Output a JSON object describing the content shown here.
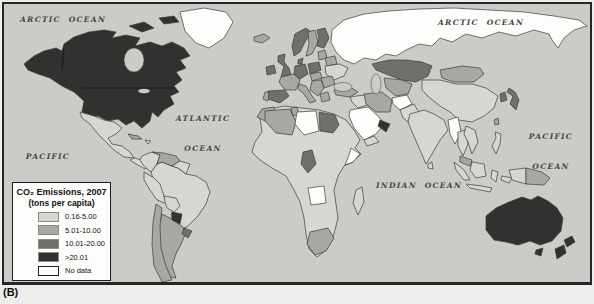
{
  "figure": {
    "caption": "(B)"
  },
  "legend": {
    "title": "CO₂ Emissions, 2007",
    "subtitle": "(tons per capita)",
    "classes": [
      {
        "label": "0.16-5.00",
        "color": "#d6d7d1"
      },
      {
        "label": "5.01-10.00",
        "color": "#a6a8a2"
      },
      {
        "label": "10.01-20.00",
        "color": "#6d706b"
      },
      {
        "label": ">20.01",
        "color": "#313230"
      },
      {
        "label": "No data",
        "color": "#fdfdfb"
      }
    ]
  },
  "map": {
    "ocean_color": "#cbccc7",
    "outline_color": "#3c3c3a",
    "labels": {
      "arctic_left": "ARCTIC  OCEAN",
      "arctic_right": "ARCTIC  OCEAN",
      "atlantic_line1": "ATLANTIC",
      "atlantic_line2": "OCEAN",
      "pacific_left_line1": "PACIFIC",
      "pacific_left_line2": "OCEAN",
      "pacific_right_line1": "PACIFIC",
      "pacific_right_line2": "OCEAN",
      "indian": "INDIAN  OCEAN"
    },
    "category_colors": {
      "0": "#fdfdfb",
      "1": "#d6d7d1",
      "2": "#a6a8a2",
      "3": "#6d706b",
      "4": "#313230"
    },
    "regions": {
      "north-america": 4,
      "canadian-arctic-islands-a": 4,
      "canadian-arctic-islands-b": 4,
      "greenland": 0,
      "mexico": 1,
      "central-america": 1,
      "cuba": 2,
      "hispaniola": 1,
      "colombia": 1,
      "venezuela": 2,
      "guianas": 1,
      "brazil": 1,
      "peru": 1,
      "bolivia": 1,
      "paraguay": 4,
      "uruguay": 3,
      "argentina": 2,
      "chile": 2,
      "iceland": 2,
      "ireland": 3,
      "uk": 3,
      "norway": 3,
      "sweden": 2,
      "finland": 3,
      "denmark": 3,
      "germany": 3,
      "poland": 3,
      "baltics": 2,
      "belarus": 2,
      "ukraine": 1,
      "czech-hungary": 2,
      "romania-bulgaria": 2,
      "balkans": 2,
      "greece": 2,
      "france": 2,
      "spain": 3,
      "portugal": 2,
      "italy": 2,
      "russia": 0,
      "kazakhstan": 3,
      "central-asia": 2,
      "mongolia": 2,
      "china": 1,
      "japan": 3,
      "south-korea": 3,
      "taiwan": 2,
      "turkey": 2,
      "syria-iraq": 1,
      "iran": 2,
      "afghanistan": 0,
      "pakistan": 1,
      "india": 1,
      "sri-lanka": 1,
      "saudi-arabia": 0,
      "gulf-states": 4,
      "yemen": 1,
      "myanmar": 0,
      "thailand": 1,
      "vietnam-laos": 1,
      "malaysia": 2,
      "sumatra": 1,
      "borneo": 1,
      "java": 1,
      "sulawesi": 1,
      "maluku": 1,
      "philippines": 1,
      "new-guinea-west": 1,
      "papua-new-guinea": 2,
      "africa": 1,
      "morocco": 2,
      "algeria": 2,
      "tunisia": 2,
      "libya": 0,
      "egypt": 3,
      "cameroon-gabon": 3,
      "angola": 0,
      "somalia": 0,
      "south-africa": 2,
      "madagascar": 1,
      "australia": 4,
      "tasmania": 4,
      "new-zealand-north": 4,
      "new-zealand-south": 4
    }
  }
}
